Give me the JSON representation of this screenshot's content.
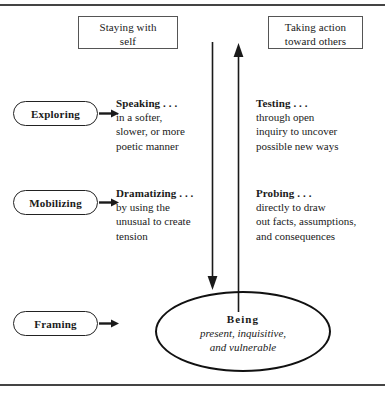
{
  "figure": {
    "frame": {
      "border_color": "#444444"
    },
    "headers": [
      {
        "name": "staying-with-self",
        "label": "Staying with\nself"
      },
      {
        "name": "taking-action-toward-others",
        "label": "Taking action\ntoward others"
      }
    ],
    "rows": [
      {
        "name": "exploring",
        "capsule_label": "Exploring"
      },
      {
        "name": "mobilizing",
        "capsule_label": "Mobilizing"
      },
      {
        "name": "framing",
        "capsule_label": "Framing"
      }
    ],
    "blocks": [
      {
        "name": "speaking",
        "head": "Speaking . . .",
        "body": "in a softer,\nslower, or more\npoetic manner"
      },
      {
        "name": "testing",
        "head": "Testing . . .",
        "body": "through open\ninquiry to uncover\npossible new ways"
      },
      {
        "name": "dramatizing",
        "head": "Dramatizing . . .",
        "body": "by using the\nunusual to create\ntension"
      },
      {
        "name": "probing",
        "head": "Probing . . .",
        "body": "directly to draw\nout facts, assumptions,\nand consequences"
      }
    ],
    "being": {
      "title": "Being",
      "subtitle": "present, inquisitive,\nand vulnerable"
    },
    "icons": {
      "right_arrow": "arrow-right-icon",
      "up_arrow": "arrow-up-icon",
      "down_arrow": "arrow-down-icon"
    },
    "colors": {
      "ink": "#1a1a1a",
      "line": "#222222",
      "box_border": "#555555",
      "rule": "#444444"
    }
  }
}
